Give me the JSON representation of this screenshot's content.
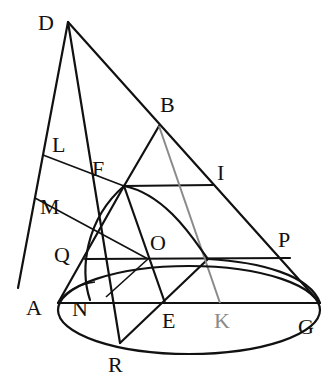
{
  "figure": {
    "labels": {
      "D": "D",
      "B": "B",
      "L": "L",
      "F": "F",
      "I": "I",
      "M": "M",
      "Q": "Q",
      "O": "O",
      "P": "P",
      "A": "A",
      "N": "N",
      "E": "E",
      "K": "K",
      "G": "G",
      "R": "R"
    },
    "colors": {
      "ink": "#111111",
      "highlight_line": "#8a8a8a"
    }
  }
}
